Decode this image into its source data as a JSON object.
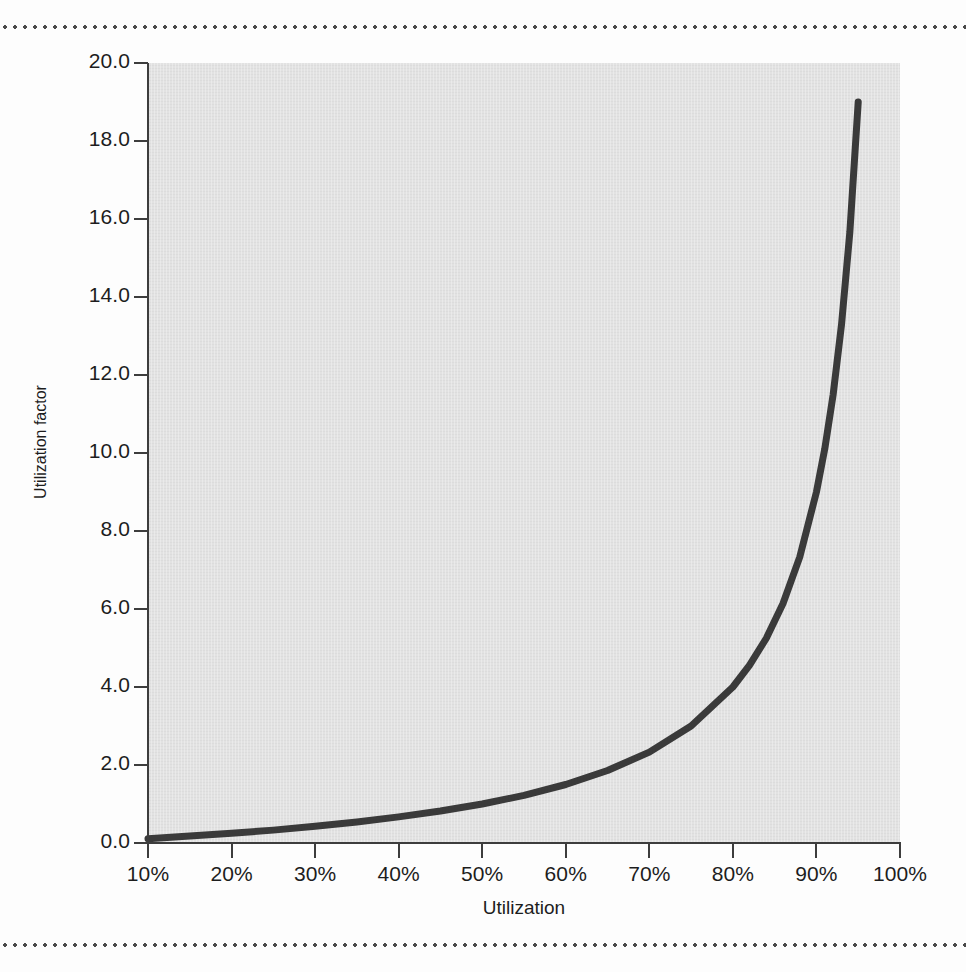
{
  "figure": {
    "background_color": "#fdfdfd",
    "plot_background_color": "#e2e2e2",
    "curve_color": "#3a3a3a",
    "axis_color": "#3d3d3d",
    "rule_color": "#4a4a4a"
  },
  "chart_data": {
    "type": "line",
    "title": "",
    "xlabel": "Utilization",
    "ylabel": "Utilization factor",
    "xlim": [
      10,
      100
    ],
    "ylim": [
      0.0,
      20.0
    ],
    "grid": false,
    "legend": null,
    "x_tick_labels": [
      "10%",
      "20%",
      "30%",
      "40%",
      "50%",
      "60%",
      "70%",
      "80%",
      "90%",
      "100%"
    ],
    "x_tick_values": [
      10,
      20,
      30,
      40,
      50,
      60,
      70,
      80,
      90,
      100
    ],
    "y_tick_labels": [
      "0.0",
      "2.0",
      "4.0",
      "6.0",
      "8.0",
      "10.0",
      "12.0",
      "14.0",
      "16.0",
      "18.0",
      "20.0"
    ],
    "y_tick_values": [
      0,
      2,
      4,
      6,
      8,
      10,
      12,
      14,
      16,
      18,
      20
    ],
    "series": [
      {
        "name": "Utilization factor",
        "formula": "u / (1 - u)",
        "x": [
          10,
          15,
          20,
          25,
          30,
          35,
          40,
          45,
          50,
          55,
          60,
          65,
          70,
          75,
          80,
          82,
          84,
          86,
          88,
          90,
          91,
          92,
          93,
          94,
          95
        ],
        "values": [
          0.11,
          0.18,
          0.25,
          0.33,
          0.43,
          0.54,
          0.67,
          0.82,
          1.0,
          1.22,
          1.5,
          1.86,
          2.33,
          3.0,
          4.0,
          4.56,
          5.25,
          6.14,
          7.33,
          9.0,
          10.11,
          11.5,
          13.29,
          15.67,
          19.0
        ]
      }
    ]
  },
  "annotations": {
    "top_rule": "dotted-rule",
    "bottom_rule": "dotted-rule"
  }
}
